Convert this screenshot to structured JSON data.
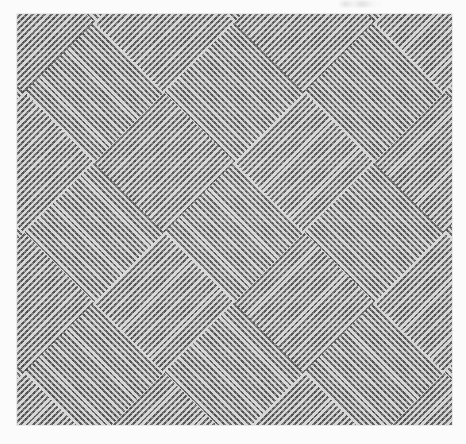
{
  "page": {
    "background_color": "#fbfbfb",
    "width": 466,
    "height": 444
  },
  "artifact": {
    "name": "scan-smudge",
    "description": "faint grey smudge at top edge",
    "color": "#787878"
  },
  "plate": {
    "label": "optical-art-pattern-plate",
    "x": 17,
    "y": 14,
    "width": 435,
    "height": 411,
    "mean_tone": "#9a9a9a",
    "ink_dark": "#3e3e3e",
    "ink_light": "#e6e6e6",
    "border_color": "#8c8c8c"
  },
  "chart_data": {
    "type": "heatmap",
    "title": "Nested chevron / diamond contour field",
    "subtitle": "Halftone-printed op-art plate, 45° crossed line families",
    "xlabel": "",
    "ylabel": "",
    "grid": false,
    "legend": "none",
    "pattern": {
      "motif": "nested-diamonds-and-chevrons",
      "stripe_angles_deg": [
        45,
        -45
      ],
      "stripe_period_px": 4.4,
      "stripe_dark_width_px": 2.1,
      "stripe_light_width_px": 2.3,
      "lattice_period_px": 140,
      "feature_types": [
        "concentric-diamond-center",
        "x-saddle-point"
      ],
      "feature_alternation": "checkerboard",
      "halftone_screen_px": 1.35,
      "halftone_angle_deg": 0
    },
    "feature_centers": {
      "columns_x": [
        22,
        160,
        300,
        440
      ],
      "rows_y": [
        22,
        160,
        290,
        424
      ],
      "diamond_centers": [
        [
          160,
          160
        ],
        [
          300,
          290
        ],
        [
          22,
          290
        ],
        [
          440,
          160
        ],
        [
          22,
          22
        ],
        [
          300,
          22
        ],
        [
          160,
          424
        ],
        [
          440,
          424
        ]
      ],
      "saddle_centers": [
        [
          300,
          160
        ],
        [
          160,
          290
        ],
        [
          22,
          160
        ],
        [
          440,
          290
        ],
        [
          160,
          22
        ],
        [
          440,
          22
        ],
        [
          22,
          424
        ],
        [
          300,
          424
        ]
      ]
    },
    "x": [
      0,
      140,
      280,
      420
    ],
    "values": [
      [
        1,
        0,
        1,
        0
      ],
      [
        0,
        1,
        0,
        1
      ],
      [
        1,
        0,
        1,
        0
      ],
      [
        0,
        1,
        0,
        1
      ]
    ],
    "categories": [
      "col-1",
      "col-2",
      "col-3",
      "col-4"
    ],
    "xlim": [
      0,
      435
    ],
    "ylim": [
      0,
      411
    ]
  }
}
